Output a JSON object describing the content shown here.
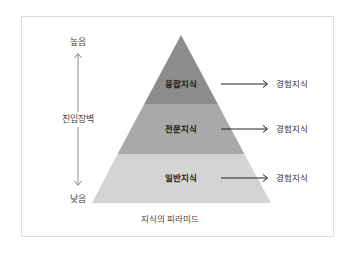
{
  "diagram": {
    "type": "pyramid",
    "title": "지식의 피라미드",
    "axis": {
      "label": "진입장벽",
      "top_label": "높음",
      "bottom_label": "낮음"
    },
    "tiers": [
      {
        "label": "융합지식",
        "output": "경험지식",
        "color": "#8c8c8c"
      },
      {
        "label": "전문지식",
        "output": "경험지식",
        "color": "#a9a9a9"
      },
      {
        "label": "일반지식",
        "output": "경험지식",
        "color": "#d4d4d4"
      }
    ],
    "colors": {
      "frame_border": "#dcdcdc",
      "axis_line": "#8a8a8a",
      "arrow": "#222222"
    }
  }
}
